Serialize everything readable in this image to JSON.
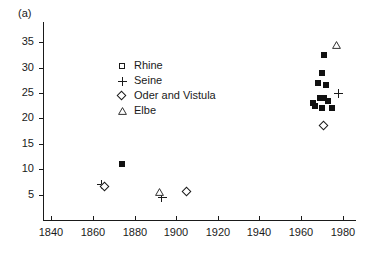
{
  "figure": {
    "panel_label": "(a)",
    "background": "#ffffff",
    "ink": "#1a1a1a"
  },
  "legend": {
    "position": "upper-center-left",
    "entries": [
      {
        "label": "Rhine",
        "marker": "square-open-icon",
        "series": "Rhine"
      },
      {
        "label": "Seine",
        "marker": "plus-icon",
        "series": "Seine"
      },
      {
        "label": "Oder and Vistula",
        "marker": "diamond-open-icon",
        "series": "Oder and Vistula"
      },
      {
        "label": "Elbe",
        "marker": "triangle-open-icon",
        "series": "Elbe"
      }
    ]
  },
  "axes": {
    "x": {
      "ticks": [
        1840,
        1860,
        1880,
        1900,
        1920,
        1940,
        1960,
        1980
      ],
      "labels": [
        "1840",
        "1860",
        "1880",
        "1900",
        "1920",
        "1940",
        "1960",
        "1980"
      ],
      "min": 1836,
      "max": 1986
    },
    "y": {
      "ticks": [
        5,
        10,
        15,
        20,
        25,
        30,
        35
      ],
      "labels": [
        "5",
        "10",
        "15",
        "20",
        "25",
        "30",
        "35"
      ],
      "min": 0,
      "max": 39
    }
  },
  "chart_data": {
    "type": "scatter",
    "title": "(a)",
    "xlabel": "",
    "ylabel": "",
    "xlim": [
      1836,
      1986
    ],
    "ylim": [
      0,
      39
    ],
    "grid": false,
    "legend_position": "upper-center-left",
    "series": [
      {
        "name": "Rhine",
        "marker": "filled-square",
        "points": [
          {
            "x": 1874,
            "y": 11.0
          },
          {
            "x": 1971,
            "y": 32.5
          },
          {
            "x": 1970,
            "y": 29.0
          },
          {
            "x": 1968,
            "y": 27.0
          },
          {
            "x": 1972,
            "y": 26.5
          },
          {
            "x": 1969,
            "y": 24.0
          },
          {
            "x": 1971,
            "y": 24.0
          },
          {
            "x": 1973,
            "y": 23.5
          },
          {
            "x": 1966,
            "y": 23.0
          },
          {
            "x": 1967,
            "y": 22.5
          },
          {
            "x": 1970,
            "y": 22.0
          },
          {
            "x": 1975,
            "y": 22.0
          }
        ]
      },
      {
        "name": "Seine",
        "marker": "plus",
        "points": [
          {
            "x": 1864,
            "y": 7.0
          },
          {
            "x": 1893,
            "y": 4.5
          },
          {
            "x": 1978,
            "y": 25.0
          }
        ]
      },
      {
        "name": "Oder and Vistula",
        "marker": "open-diamond",
        "points": [
          {
            "x": 1866,
            "y": 6.5
          },
          {
            "x": 1905,
            "y": 5.5
          },
          {
            "x": 1971,
            "y": 18.5
          }
        ]
      },
      {
        "name": "Elbe",
        "marker": "open-triangle",
        "points": [
          {
            "x": 1892,
            "y": 5.5
          },
          {
            "x": 1977,
            "y": 34.5
          }
        ]
      }
    ]
  }
}
